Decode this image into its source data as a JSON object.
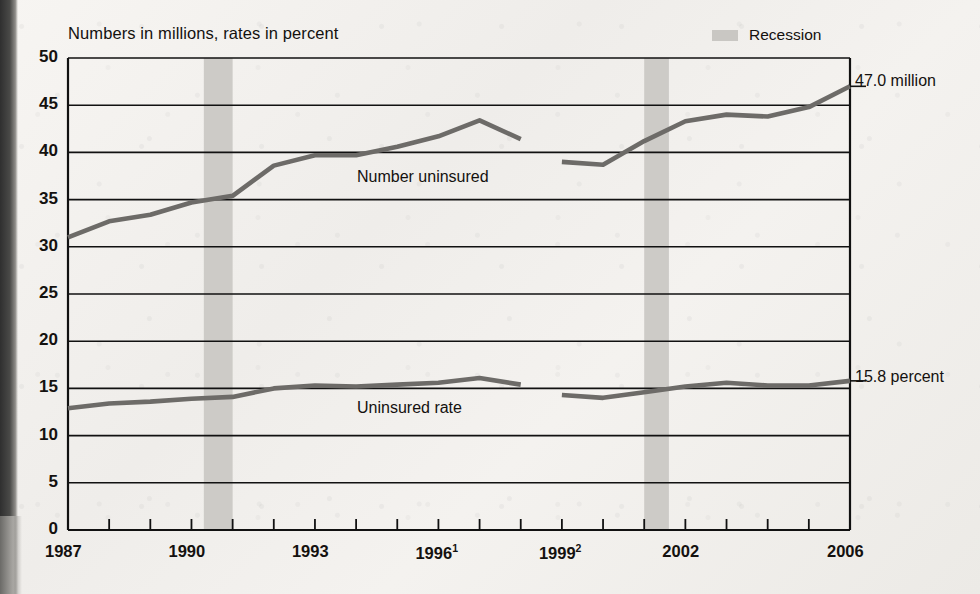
{
  "subtitle": "Numbers in millions, rates in percent",
  "legend": {
    "label": "Recession",
    "swatch_color": "#c9c7c3"
  },
  "annotations": {
    "number_end": "47.0 million",
    "rate_end": "15.8 percent",
    "series_number_label": "Number uninsured",
    "series_rate_label": "Uninsured rate"
  },
  "colors": {
    "line": "#6d6b68",
    "axis": "#111111",
    "recession_band": "#cdcbc7",
    "paper": "#f2f0ed"
  },
  "chart_data": {
    "type": "line",
    "title": "",
    "subtitle": "Numbers in millions, rates in percent",
    "xlabel": "",
    "ylabel": "",
    "xlim": [
      1987,
      2006
    ],
    "ylim": [
      0,
      50
    ],
    "ytick_values": [
      0,
      5,
      10,
      15,
      20,
      25,
      30,
      35,
      40,
      45,
      50
    ],
    "ytick_labels": [
      "0",
      "5",
      "10",
      "15",
      "20",
      "25",
      "30",
      "35",
      "40",
      "45",
      "50"
    ],
    "xtick_values": [
      1987,
      1988,
      1989,
      1990,
      1991,
      1992,
      1993,
      1994,
      1995,
      1996,
      1997,
      1998,
      1999,
      2000,
      2001,
      2002,
      2003,
      2004,
      2005,
      2006
    ],
    "xtick_labels": [
      {
        "value": 1987,
        "label": "1987",
        "sup": ""
      },
      {
        "value": 1990,
        "label": "1990",
        "sup": ""
      },
      {
        "value": 1993,
        "label": "1993",
        "sup": ""
      },
      {
        "value": 1996,
        "label": "1996",
        "sup": "1"
      },
      {
        "value": 1999,
        "label": "1999",
        "sup": "2"
      },
      {
        "value": 2002,
        "label": "2002",
        "sup": ""
      },
      {
        "value": 2006,
        "label": "2006",
        "sup": ""
      }
    ],
    "grid": "horizontal",
    "legend_position": "top-right",
    "recession_bands": [
      {
        "start": 1990.3,
        "end": 1991.0
      },
      {
        "start": 2001.0,
        "end": 2001.6
      }
    ],
    "series": [
      {
        "name": "Number uninsured",
        "unit": "millions",
        "segments": [
          {
            "x": [
              1987,
              1988,
              1989,
              1990,
              1991,
              1992,
              1993,
              1994,
              1995,
              1996,
              1997,
              1998
            ],
            "values": [
              31.0,
              32.7,
              33.4,
              34.7,
              35.4,
              38.6,
              39.7,
              39.7,
              40.6,
              41.7,
              43.4,
              41.4
            ]
          },
          {
            "x": [
              1999,
              2000,
              2001,
              2002,
              2003,
              2004,
              2005,
              2006
            ],
            "values": [
              39.0,
              38.7,
              41.2,
              43.3,
              44.0,
              43.8,
              44.8,
              47.0
            ]
          }
        ]
      },
      {
        "name": "Uninsured rate",
        "unit": "percent",
        "segments": [
          {
            "x": [
              1987,
              1988,
              1989,
              1990,
              1991,
              1992,
              1993,
              1994,
              1995,
              1996,
              1997,
              1998
            ],
            "values": [
              12.9,
              13.4,
              13.6,
              13.9,
              14.1,
              15.0,
              15.3,
              15.2,
              15.4,
              15.6,
              16.1,
              15.4
            ]
          },
          {
            "x": [
              1999,
              2000,
              2001,
              2002,
              2003,
              2004,
              2005,
              2006
            ],
            "values": [
              14.3,
              14.0,
              14.6,
              15.2,
              15.6,
              15.3,
              15.3,
              15.8
            ]
          }
        ]
      }
    ]
  }
}
